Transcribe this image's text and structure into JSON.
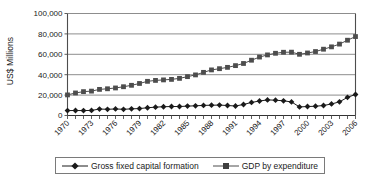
{
  "chart_data": {
    "type": "line",
    "title": "",
    "subtitle": "",
    "xlabel": "",
    "ylabel": "US$ Millions",
    "ylim": [
      0,
      100000
    ],
    "ytick_labels": [
      "0",
      "20,000",
      "40,000",
      "60,000",
      "80,000",
      "100,000"
    ],
    "ytick_values": [
      0,
      20000,
      40000,
      60000,
      80000,
      100000
    ],
    "grid": true,
    "legend_position": "bottom",
    "x": [
      1970,
      1971,
      1972,
      1973,
      1974,
      1975,
      1976,
      1977,
      1978,
      1979,
      1980,
      1981,
      1982,
      1983,
      1984,
      1985,
      1986,
      1987,
      1988,
      1989,
      1990,
      1991,
      1992,
      1993,
      1994,
      1995,
      1996,
      1997,
      1998,
      1999,
      2000,
      2001,
      2002,
      2003,
      2004,
      2005,
      2006
    ],
    "xtick_labels": [
      "1970",
      "1973",
      "1976",
      "1979",
      "1982",
      "1985",
      "1988",
      "1991",
      "1994",
      "1997",
      "2000",
      "2003",
      "2006"
    ],
    "xtick_values": [
      1970,
      1973,
      1976,
      1979,
      1982,
      1985,
      1988,
      1991,
      1994,
      1997,
      2000,
      2003,
      2006
    ],
    "series": [
      {
        "name": "Gross fixed capital formation",
        "marker": "diamond",
        "color": "#1a1a1a",
        "values": [
          4800,
          4900,
          4800,
          5000,
          6300,
          6100,
          6400,
          6100,
          6500,
          6800,
          7600,
          8200,
          8600,
          8800,
          8800,
          9200,
          9500,
          9900,
          10100,
          10200,
          9800,
          9300,
          10800,
          12800,
          14200,
          15300,
          15000,
          14400,
          13300,
          8400,
          8800,
          9100,
          9800,
          11300,
          13400,
          17800,
          20600
        ]
      },
      {
        "name": "GDP by expenditure",
        "marker": "square",
        "color": "#4d4d4d",
        "values": [
          20200,
          22100,
          23400,
          23900,
          25600,
          26200,
          27000,
          28200,
          29600,
          31400,
          33500,
          34400,
          34900,
          35400,
          36400,
          38100,
          39800,
          42300,
          44700,
          45900,
          47200,
          48900,
          51000,
          54200,
          57300,
          59400,
          61000,
          62000,
          62100,
          60000,
          61300,
          62700,
          65000,
          67300,
          70000,
          73800,
          77400
        ]
      }
    ]
  },
  "legend": {
    "items": [
      {
        "label": "Gross fixed capital formation",
        "marker": "diamond"
      },
      {
        "label": "GDP by expenditure",
        "marker": "square"
      }
    ]
  }
}
